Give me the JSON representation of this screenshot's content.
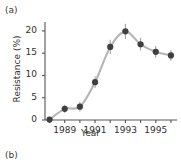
{
  "figure": {
    "panel_a_label": "(a)",
    "panel_b_label": "(b)"
  },
  "chart_data": {
    "type": "scatter",
    "title": "",
    "xlabel": "Year",
    "ylabel": "Resistance (%)",
    "x": [
      1988,
      1989,
      1990,
      1991,
      1992,
      1993,
      1994,
      1995,
      1996
    ],
    "values": [
      0.1,
      2.5,
      3.0,
      8.5,
      16.4,
      19.9,
      17.0,
      15.3,
      14.5
    ],
    "errors": [
      0.0,
      0.9,
      1.1,
      1.3,
      1.6,
      1.7,
      1.4,
      1.3,
      1.2
    ],
    "xlim": [
      1987.7,
      1996.4
    ],
    "ylim": [
      0,
      22
    ],
    "xticks": [
      1988,
      1989,
      1990,
      1991,
      1992,
      1993,
      1994,
      1995,
      1996
    ],
    "xtick_labels": [
      "",
      "1989",
      "",
      "1991",
      "",
      "1993",
      "",
      "1995",
      ""
    ],
    "yticks": [
      0,
      5,
      10,
      15,
      20
    ],
    "ytick_labels": [
      "0",
      "5",
      "10",
      "15",
      "20"
    ],
    "grid": false,
    "legend": "none",
    "marker_color": "#3f3f3f",
    "line_color": "#b5b5b5",
    "axis_color": "#555555",
    "fit_line": "smooth sigmoid rise then decline"
  }
}
